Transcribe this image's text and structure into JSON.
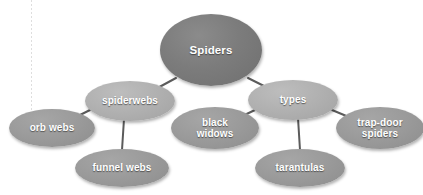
{
  "diagram": {
    "background_color": "#ffffff",
    "edge_color": "#5b5b5b",
    "root_fill": "#7c7c7c",
    "mid_fill": "#b0b0b0",
    "leaf_fill": "#9a9a9a",
    "label_color": "#ffffff",
    "guide_line_color": "#d8d8d8"
  },
  "nodes": {
    "root": {
      "label": "Spiders",
      "cx": 211,
      "cy": 50,
      "rx": 51,
      "ry": 36
    },
    "spiderwebs": {
      "label": "spiderwebs",
      "cx": 130,
      "cy": 101,
      "rx": 45,
      "ry": 20
    },
    "types": {
      "label": "types",
      "cx": 293,
      "cy": 100,
      "rx": 45,
      "ry": 20
    },
    "orb_webs": {
      "label": "orb  webs",
      "cx": 52,
      "cy": 128,
      "rx": 43,
      "ry": 19
    },
    "funnel_webs": {
      "label": "funnel  webs",
      "cx": 122,
      "cy": 168,
      "rx": 47,
      "ry": 19
    },
    "black_widows": {
      "label": "black\nwidows",
      "cx": 215,
      "cy": 128,
      "rx": 44,
      "ry": 21
    },
    "tarantulas": {
      "label": "tarantulas",
      "cx": 300,
      "cy": 168,
      "rx": 45,
      "ry": 19
    },
    "trap_door_spiders": {
      "label": "trap-door\nspiders",
      "cx": 380,
      "cy": 128,
      "rx": 44,
      "ry": 21
    }
  },
  "edges": [
    {
      "name": "root-to-spiderwebs",
      "x1": 176,
      "y1": 78,
      "x2": 152,
      "y2": 91
    },
    {
      "name": "root-to-types",
      "x1": 248,
      "y1": 78,
      "x2": 272,
      "y2": 90
    },
    {
      "name": "spiderwebs-to-orb-webs",
      "x1": 92,
      "y1": 109,
      "x2": 72,
      "y2": 119
    },
    {
      "name": "spiderwebs-to-funnel-webs",
      "x1": 124,
      "y1": 119,
      "x2": 122,
      "y2": 150
    },
    {
      "name": "types-to-black-widows",
      "x1": 255,
      "y1": 110,
      "x2": 234,
      "y2": 120
    },
    {
      "name": "types-to-tarantulas",
      "x1": 298,
      "y1": 118,
      "x2": 300,
      "y2": 150
    },
    {
      "name": "types-to-trap-door-spiders",
      "x1": 332,
      "y1": 110,
      "x2": 356,
      "y2": 120
    }
  ]
}
